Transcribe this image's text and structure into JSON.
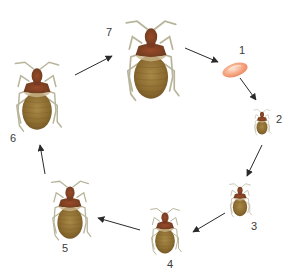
{
  "stages": [
    {
      "number": "1",
      "name": "egg"
    },
    {
      "number": "2",
      "name": "nymph-instar-1"
    },
    {
      "number": "3",
      "name": "nymph-instar-2"
    },
    {
      "number": "4",
      "name": "nymph-instar-3"
    },
    {
      "number": "5",
      "name": "nymph-instar-4"
    },
    {
      "number": "6",
      "name": "nymph-instar-5"
    },
    {
      "number": "7",
      "name": "adult"
    }
  ],
  "flow": [
    "7→1",
    "1→2",
    "2→3",
    "3→4",
    "4→5",
    "5→6",
    "6→7"
  ],
  "colors": {
    "body": "#8a6a2e",
    "body_dark": "#6b3b1e",
    "thorax": "#7a3a22",
    "legs": "#b8b49a",
    "egg": "#f3a07a",
    "arrow": "#2a2a2a"
  }
}
